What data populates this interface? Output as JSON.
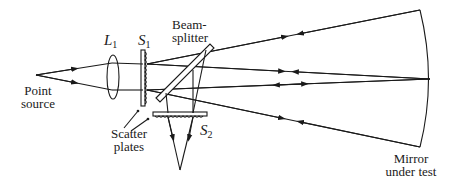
{
  "diagram": {
    "labels": {
      "lens": {
        "main": "L",
        "sub": "1"
      },
      "scatter_plate_1": {
        "main": "S",
        "sub": "1"
      },
      "scatter_plate_2": {
        "main": "S",
        "sub": "2"
      },
      "beamsplitter_line1": "Beam-",
      "beamsplitter_line2": "splitter",
      "point_source_line1": "Point",
      "point_source_line2": "source",
      "scatter_plates_line1": "Scatter",
      "scatter_plates_line2": "plates",
      "mirror_line1": "Mirror",
      "mirror_line2": "under test"
    },
    "colors": {
      "line": "#1a1a1a",
      "background": "#ffffff"
    },
    "components": [
      "point-source",
      "lens-L1",
      "scatter-plate-S1",
      "beamsplitter",
      "scatter-plate-S2",
      "mirror-under-test"
    ]
  }
}
